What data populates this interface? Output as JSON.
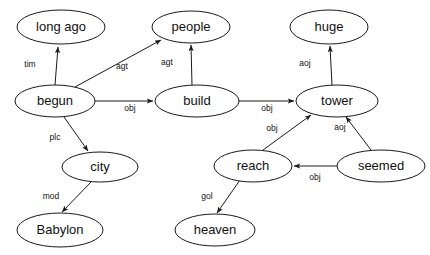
{
  "diagram": {
    "background_color": "#ffffff",
    "stroke_color": "#1a1a1a",
    "text_color": "#111111",
    "nodes": [
      {
        "id": "long_ago",
        "label": "long ago",
        "cx": 61,
        "cy": 27,
        "rx": 44,
        "ry": 17
      },
      {
        "id": "people",
        "label": "people",
        "cx": 191,
        "cy": 27,
        "rx": 39,
        "ry": 16
      },
      {
        "id": "huge",
        "label": "huge",
        "cx": 329,
        "cy": 27,
        "rx": 39,
        "ry": 17
      },
      {
        "id": "begun",
        "label": "begun",
        "cx": 55,
        "cy": 101,
        "rx": 40,
        "ry": 16
      },
      {
        "id": "build",
        "label": "build",
        "cx": 197,
        "cy": 101,
        "rx": 42,
        "ry": 16
      },
      {
        "id": "tower",
        "label": "tower",
        "cx": 337,
        "cy": 101,
        "rx": 41,
        "ry": 16
      },
      {
        "id": "city",
        "label": "city",
        "cx": 100,
        "cy": 167,
        "rx": 38,
        "ry": 15
      },
      {
        "id": "reach",
        "label": "reach",
        "cx": 253,
        "cy": 166,
        "rx": 39,
        "ry": 16
      },
      {
        "id": "seemed",
        "label": "seemed",
        "cx": 381,
        "cy": 166,
        "rx": 44,
        "ry": 16
      },
      {
        "id": "Babylon",
        "label": "Babylon",
        "cx": 60,
        "cy": 230,
        "rx": 43,
        "ry": 17
      },
      {
        "id": "heaven",
        "label": "heaven",
        "cx": 215,
        "cy": 230,
        "rx": 40,
        "ry": 16
      }
    ],
    "edges": [
      {
        "id": "begun-long_ago",
        "from": "begun",
        "to": "long_ago",
        "label": "tim",
        "x1": 55,
        "y1": 85,
        "x2": 58,
        "y2": 47,
        "lx": 30,
        "ly": 65
      },
      {
        "id": "begun-people",
        "from": "begun",
        "to": "people",
        "label": "agt",
        "x1": 75,
        "y1": 87,
        "x2": 161,
        "y2": 40,
        "lx": 122,
        "ly": 67
      },
      {
        "id": "begun-build",
        "from": "begun",
        "to": "build",
        "label": "obj",
        "x1": 95,
        "y1": 101,
        "x2": 153,
        "y2": 101,
        "lx": 130,
        "ly": 109
      },
      {
        "id": "begun-city",
        "from": "begun",
        "to": "city",
        "label": "plc",
        "x1": 64,
        "y1": 117,
        "x2": 88,
        "y2": 151,
        "lx": 55,
        "ly": 138
      },
      {
        "id": "build-people",
        "from": "build",
        "to": "people",
        "label": "agt",
        "x1": 192,
        "y1": 85,
        "x2": 191,
        "y2": 45,
        "lx": 167,
        "ly": 63
      },
      {
        "id": "build-tower",
        "from": "build",
        "to": "tower",
        "label": "obj",
        "x1": 239,
        "y1": 101,
        "x2": 294,
        "y2": 101,
        "lx": 267,
        "ly": 109
      },
      {
        "id": "tower-huge",
        "from": "tower",
        "to": "huge",
        "label": "aoj",
        "x1": 332,
        "y1": 85,
        "x2": 330,
        "y2": 46,
        "lx": 305,
        "ly": 64
      },
      {
        "id": "reach-tower",
        "from": "reach",
        "to": "tower",
        "label": "obj",
        "x1": 263,
        "y1": 150,
        "x2": 311,
        "y2": 115,
        "lx": 272,
        "ly": 129
      },
      {
        "id": "seemed-tower",
        "from": "seemed",
        "to": "tower",
        "label": "aoj",
        "x1": 371,
        "y1": 150,
        "x2": 346,
        "y2": 117,
        "lx": 340,
        "ly": 128
      },
      {
        "id": "seemed-reach",
        "from": "seemed",
        "to": "reach",
        "label": "obj",
        "x1": 337,
        "y1": 166,
        "x2": 294,
        "y2": 166,
        "lx": 315,
        "ly": 178
      },
      {
        "id": "reach-heaven",
        "from": "reach",
        "to": "heaven",
        "label": "gol",
        "x1": 240,
        "y1": 180,
        "x2": 217,
        "y2": 213,
        "lx": 207,
        "ly": 197
      },
      {
        "id": "city-Babylon",
        "from": "city",
        "to": "Babylon",
        "label": "mod",
        "x1": 92,
        "y1": 181,
        "x2": 62,
        "y2": 212,
        "lx": 51,
        "ly": 197
      }
    ]
  }
}
